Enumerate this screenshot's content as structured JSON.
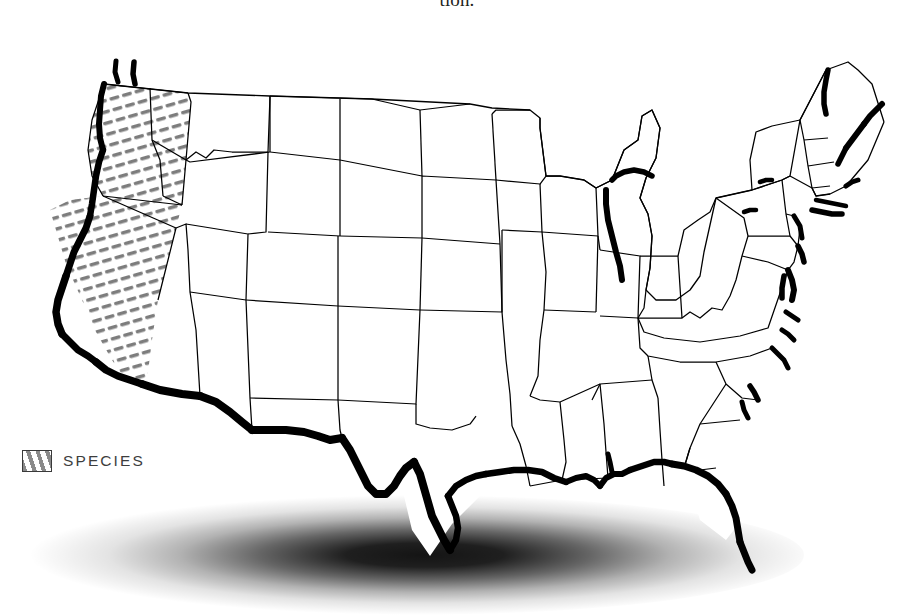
{
  "figure": {
    "caption_fragment": "tion.",
    "background_color": "#ffffff"
  },
  "legend": {
    "label": "SPECIES",
    "swatch_style": "diagonal-hatch",
    "swatch_hatch_color": "#8a8a8a",
    "swatch_border_color": "#3a3a3a",
    "text_color": "#3d3d3d"
  },
  "map": {
    "region": "Contiguous United States",
    "projection_note": "slightly curved pseudo-3D plan view with drop shadow",
    "state_border_color": "#000000",
    "coastal_range_color": "#000000",
    "hatch_color": "#808080",
    "shadow_color": "#000000",
    "legend_classes": [
      {
        "name": "SPECIES",
        "symbol": "diagonal-hatch",
        "color": "#8a8a8a",
        "description": "inland hatched range in western Oregon and California"
      },
      {
        "name": "coastal range",
        "symbol": "thick-black-outline",
        "color": "#000000",
        "description": "heavy black shoreline band marking coastal occurrence"
      }
    ],
    "hatched_states": [
      "Oregon",
      "California"
    ],
    "heavy_coast_regions": [
      "Pacific coast (Washington, Oregon, California)",
      "US-Mexico border / Rio Grande (Texas)",
      "Gulf coast (Texas, Louisiana, Mississippi, Alabama, Florida)",
      "Florida Gulf coast",
      "Atlantic coast (Carolinas, Chesapeake Bay, New Jersey, Long Island, New England, Maine)",
      "Lake Michigan shoreline"
    ]
  }
}
